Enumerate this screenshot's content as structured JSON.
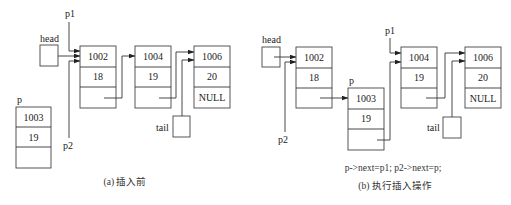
{
  "diagram_a": {
    "caption": "(a) 插入前",
    "head_label": "head",
    "p1_label": "p1",
    "p2_label": "p2",
    "tail_label": "tail",
    "p_label": "p",
    "nodes": [
      {
        "addr": "1002",
        "value": "18",
        "next": ""
      },
      {
        "addr": "1004",
        "value": "19",
        "next": ""
      },
      {
        "addr": "1006",
        "value": "20",
        "next": "NULL"
      }
    ],
    "p_node": {
      "addr": "1003",
      "value": "19",
      "next": ""
    }
  },
  "diagram_b": {
    "caption": "(b) 执行插入操作",
    "code": "p->next=p1; p2->next=p;",
    "head_label": "head",
    "p1_label": "p1",
    "p2_label": "p2",
    "tail_label": "tail",
    "p_label": "p",
    "nodes": [
      {
        "addr": "1002",
        "value": "18",
        "next": ""
      },
      {
        "addr": "1003",
        "value": "19",
        "next": ""
      },
      {
        "addr": "1004",
        "value": "19",
        "next": ""
      },
      {
        "addr": "1006",
        "value": "20",
        "next": "NULL"
      }
    ]
  }
}
